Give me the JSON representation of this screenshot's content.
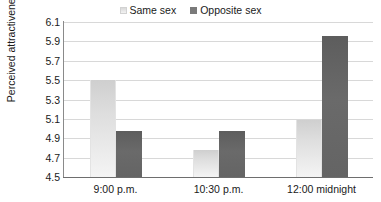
{
  "chart_data": {
    "type": "bar",
    "title": "",
    "subtitle": "",
    "xlabel": "",
    "ylabel": "Perceived attractiveness",
    "categories": [
      "9:00 p.m.",
      "10:30 p.m.",
      "12:00 midnight"
    ],
    "series": [
      {
        "name": "Same sex",
        "color": "#e6e6e6",
        "values": [
          5.5,
          4.78,
          5.09
        ]
      },
      {
        "name": "Opposite sex",
        "color": "#666666",
        "values": [
          4.98,
          4.97,
          5.96
        ]
      }
    ],
    "ylim": [
      4.5,
      6.1
    ],
    "ytick_step": 0.2,
    "ytick_labels": [
      "6.1",
      "5.9",
      "5.7",
      "5.5",
      "5.3",
      "5.1",
      "4.9",
      "4.7",
      "4.5"
    ],
    "grid": "horizontal",
    "legend_position": "top-center",
    "legend_entries": [
      "Same sex",
      "Opposite sex"
    ]
  },
  "legend": {
    "same_label": "Same sex",
    "opposite_label": "Opposite sex"
  },
  "axes": {
    "y_title": "Perceived attractiveness"
  }
}
